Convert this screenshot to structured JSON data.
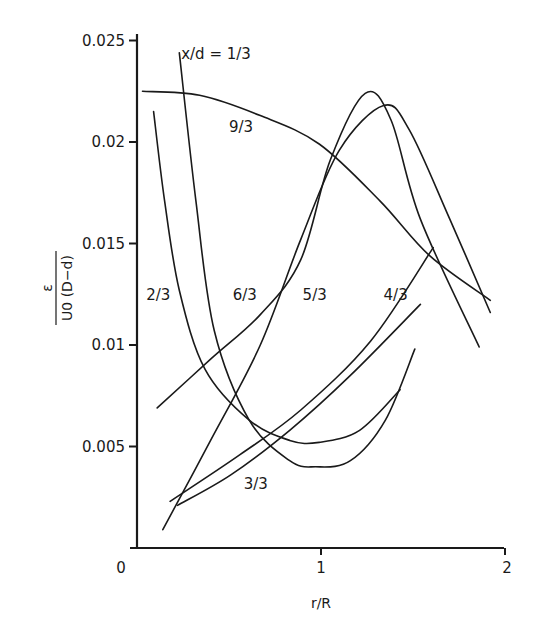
{
  "chart_data": {
    "type": "line",
    "title": "",
    "xlabel": "r/R",
    "ylabel": "ε / (U0 (D−d))",
    "ylabel_parts": {
      "numerator": "ε",
      "denominator": "U0 (D−d)",
      "sub": "0"
    },
    "xlim": [
      0,
      2
    ],
    "ylim": [
      0,
      0.025
    ],
    "grid": false,
    "legend": "none (curves labeled inline)",
    "x_ticks": [
      {
        "value": 0,
        "label": "0"
      },
      {
        "value": 1,
        "label": "1"
      },
      {
        "value": 2,
        "label": "2"
      }
    ],
    "y_ticks": [
      {
        "value": 0.005,
        "label": "0.005"
      },
      {
        "value": 0.01,
        "label": "0.01"
      },
      {
        "value": 0.015,
        "label": "0.015"
      },
      {
        "value": 0.02,
        "label": "0.02"
      },
      {
        "value": 0.025,
        "label": "0.025"
      }
    ],
    "series": [
      {
        "name": "x/d = 1/3",
        "label": "x/d = 1/3",
        "label_pos": [
          0.24,
          0.0241
        ],
        "x": [
          0.23,
          0.32,
          0.42,
          0.61,
          0.83,
          0.97,
          1.16,
          1.35,
          1.51
        ],
        "y": [
          0.0244,
          0.0171,
          0.0107,
          0.0063,
          0.0043,
          0.004,
          0.0043,
          0.0063,
          0.0098
        ]
      },
      {
        "name": "2/3",
        "label": "2/3",
        "label_pos": [
          0.05,
          0.0122
        ],
        "x": [
          0.09,
          0.15,
          0.23,
          0.37,
          0.61,
          0.83,
          0.99,
          1.21,
          1.43
        ],
        "y": [
          0.0215,
          0.0171,
          0.0127,
          0.0088,
          0.0063,
          0.0053,
          0.0052,
          0.0058,
          0.0078
        ]
      },
      {
        "name": "3/3",
        "label": "3/3",
        "label_pos": [
          0.58,
          0.0029
        ],
        "x": [
          0.22,
          0.51,
          0.83,
          1.16,
          1.54
        ],
        "y": [
          0.0021,
          0.0036,
          0.0058,
          0.0085,
          0.012
        ]
      },
      {
        "name": "4/3",
        "label": "4/3",
        "label_pos": [
          1.34,
          0.0122
        ],
        "x": [
          0.18,
          0.56,
          0.89,
          1.27,
          1.61
        ],
        "y": [
          0.0023,
          0.0046,
          0.0068,
          0.0102,
          0.0148
        ]
      },
      {
        "name": "5/3",
        "label": "5/3",
        "label_pos": [
          0.9,
          0.0122
        ],
        "x": [
          0.14,
          0.4,
          0.67,
          0.89,
          1.1,
          1.34,
          1.48,
          1.7,
          1.92
        ],
        "y": [
          0.0009,
          0.0053,
          0.01,
          0.0152,
          0.0196,
          0.0218,
          0.0206,
          0.0162,
          0.0116
        ]
      },
      {
        "name": "6/3",
        "label": "6/3",
        "label_pos": [
          0.52,
          0.0122
        ],
        "x": [
          0.11,
          0.4,
          0.67,
          0.89,
          1.05,
          1.24,
          1.38,
          1.54,
          1.86
        ],
        "y": [
          0.0069,
          0.0093,
          0.0115,
          0.0142,
          0.0191,
          0.0224,
          0.0211,
          0.0162,
          0.0099
        ]
      },
      {
        "name": "9/3",
        "label": "9/3",
        "label_pos": [
          0.5,
          0.0205
        ],
        "x": [
          0.03,
          0.34,
          0.67,
          0.99,
          1.32,
          1.59,
          1.92
        ],
        "y": [
          0.0225,
          0.0223,
          0.0213,
          0.0199,
          0.0171,
          0.0144,
          0.0122
        ]
      }
    ]
  }
}
